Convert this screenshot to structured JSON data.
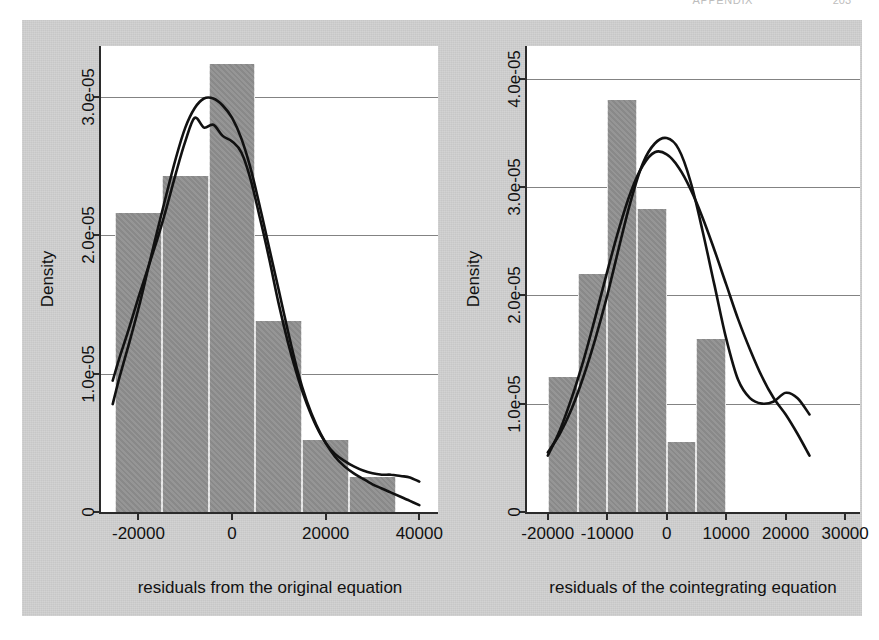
{
  "page_header": {
    "title": "APPENDIX",
    "page_number": "203"
  },
  "figure": {
    "background_color": "#cfcfcf",
    "bar_color": "#8f8f8f",
    "curve_color": "#111111"
  },
  "chart_data": [
    {
      "id": "left",
      "type": "histogram",
      "title": "",
      "xlabel": "residuals from the original equation",
      "ylabel": "Density",
      "xlim": [
        -28000,
        44000
      ],
      "ylim": [
        0,
        3.37e-05
      ],
      "grid": true,
      "legend": "none",
      "xticks": [
        -20000,
        0,
        20000,
        40000
      ],
      "xticklabels": [
        "-20000",
        "0",
        "20000",
        "40000"
      ],
      "yticks": [
        0,
        1e-05,
        2e-05,
        3e-05
      ],
      "yticklabels": [
        "0",
        "1.0e-05",
        "2.0e-05",
        "3.0e-05"
      ],
      "bin_edges": [
        -25000,
        -15000,
        -5000,
        5000,
        15000,
        25000,
        35000,
        40000
      ],
      "bin_heights": [
        2.16e-05,
        2.43e-05,
        3.24e-05,
        1.38e-05,
        5.2e-06,
        2.5e-06
      ],
      "density_curves": [
        {
          "name": "kernel-density",
          "x": [
            -25500,
            -24000,
            -22000,
            -20000,
            -18000,
            -16000,
            -14000,
            -12000,
            -10000,
            -8000,
            -6000,
            -4000,
            -2000,
            0,
            2000,
            4000,
            6000,
            8000,
            10000,
            12000,
            14000,
            16000,
            18000,
            20000,
            22000,
            24000,
            26000,
            28000,
            30000,
            32000,
            34000,
            36000,
            38000,
            40000
          ],
          "y": [
            9.5e-06,
            1.12e-05,
            1.33e-05,
            1.55e-05,
            1.76e-05,
            1.97e-05,
            2.2e-05,
            2.45e-05,
            2.68e-05,
            2.85e-05,
            2.78e-05,
            2.8e-05,
            2.72e-05,
            2.68e-05,
            2.6e-05,
            2.4e-05,
            2.12e-05,
            1.82e-05,
            1.5e-05,
            1.22e-05,
            9.8e-06,
            7.8e-06,
            6.2e-06,
            5e-06,
            4.2e-06,
            3.7e-06,
            3.3e-06,
            3e-06,
            2.8e-06,
            2.7e-06,
            2.7e-06,
            2.6e-06,
            2.5e-06,
            2.2e-06
          ]
        },
        {
          "name": "normal-fit",
          "x": [
            -25500,
            -24000,
            -22000,
            -20000,
            -18000,
            -16000,
            -14000,
            -12000,
            -10000,
            -8000,
            -6000,
            -4000,
            -2000,
            0,
            2000,
            4000,
            6000,
            8000,
            10000,
            12000,
            14000,
            16000,
            18000,
            20000,
            22000,
            24000,
            26000,
            28000,
            30000,
            32000,
            34000,
            36000,
            38000,
            40000
          ],
          "y": [
            7.8e-06,
            9.8e-06,
            1.22e-05,
            1.47e-05,
            1.75e-05,
            2.03e-05,
            2.3e-05,
            2.56e-05,
            2.78e-05,
            2.92e-05,
            2.99e-05,
            2.99e-05,
            2.94e-05,
            2.85e-05,
            2.7e-05,
            2.48e-05,
            2.2e-05,
            1.9e-05,
            1.6e-05,
            1.3e-05,
            1.02e-05,
            8e-06,
            6.3e-06,
            5e-06,
            4e-06,
            3.3e-06,
            2.8e-06,
            2.4e-06,
            2e-06,
            1.7e-06,
            1.4e-06,
            1.1e-06,
            8e-07,
            5e-07
          ]
        }
      ]
    },
    {
      "id": "right",
      "type": "histogram",
      "title": "",
      "xlabel": "residuals of the cointegrating equation",
      "ylabel": "Density",
      "xlim": [
        -23500,
        32500
      ],
      "ylim": [
        0,
        4.3e-05
      ],
      "grid": true,
      "legend": "none",
      "xticks": [
        -20000,
        -10000,
        0,
        10000,
        20000,
        30000
      ],
      "xticklabels": [
        "-20000",
        "-10000",
        "0",
        "10000",
        "20000",
        "30000"
      ],
      "yticks": [
        0,
        1e-05,
        2e-05,
        3e-05,
        4e-05
      ],
      "yticklabels": [
        "0",
        "1.0e-05",
        "2.0e-05",
        "3.0e-05",
        "4.0e-05"
      ],
      "bin_edges": [
        -20000,
        -15000,
        -10000,
        -5000,
        0,
        5000,
        10000,
        15000,
        20000,
        25000
      ],
      "bin_heights": [
        1.25e-05,
        2.2e-05,
        3.8e-05,
        2.8e-05,
        6.5e-06,
        1.6e-05
      ],
      "bin_edges_used": [
        -20000,
        -15000,
        -10000,
        -5000,
        0,
        5000,
        10000,
        15000,
        20000,
        25000
      ],
      "density_curves": [
        {
          "name": "kernel-density",
          "x": [
            -20000,
            -18000,
            -16000,
            -14000,
            -12000,
            -10000,
            -8000,
            -6000,
            -4000,
            -2000,
            0,
            2000,
            4000,
            6000,
            8000,
            10000,
            12000,
            14000,
            16000,
            18000,
            20000,
            22000,
            24000
          ],
          "y": [
            5.5e-06,
            7.2e-06,
            9.5e-06,
            1.25e-05,
            1.6e-05,
            2e-05,
            2.45e-05,
            2.88e-05,
            3.22e-05,
            3.4e-05,
            3.45e-05,
            3.35e-05,
            3.05e-05,
            2.6e-05,
            2.1e-05,
            1.6e-05,
            1.22e-05,
            1.05e-05,
            1e-05,
            1.02e-05,
            1.1e-05,
            1.05e-05,
            9e-06
          ]
        },
        {
          "name": "normal-fit",
          "x": [
            -20000,
            -18000,
            -16000,
            -14000,
            -12000,
            -10000,
            -8000,
            -6000,
            -4000,
            -2000,
            0,
            2000,
            4000,
            6000,
            8000,
            10000,
            12000,
            14000,
            16000,
            18000,
            20000,
            22000,
            24000
          ],
          "y": [
            5.2e-06,
            7.5e-06,
            1.05e-05,
            1.4e-05,
            1.8e-05,
            2.22e-05,
            2.62e-05,
            2.96e-05,
            3.2e-05,
            3.32e-05,
            3.3e-05,
            3.18e-05,
            2.98e-05,
            2.72e-05,
            2.42e-05,
            2.1e-05,
            1.78e-05,
            1.5e-05,
            1.25e-05,
            1.05e-05,
            9e-06,
            7.2e-06,
            5.2e-06
          ]
        }
      ]
    }
  ]
}
